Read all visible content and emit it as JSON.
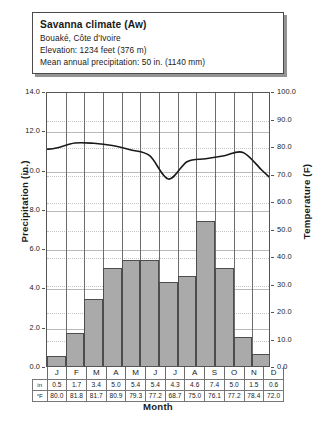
{
  "info": {
    "title": "Savanna climate (Aw)",
    "location": "Bouaké, Côte d'Ivoire",
    "elevation": "Elevation: 1234 feet (376 m)",
    "precipitation": "Mean annual precipitation: 50 in. (1140 mm)"
  },
  "chart_data": {
    "type": "bar",
    "title": "Savanna climate (Aw)",
    "xlabel": "Month",
    "ylabel": "Precipitation (in.)",
    "ylabel_secondary": "Temperature (F)",
    "categories": [
      "J",
      "F",
      "M",
      "A",
      "M",
      "J",
      "J",
      "A",
      "S",
      "O",
      "N",
      "D"
    ],
    "month_names": [
      "January",
      "February",
      "March",
      "April",
      "May",
      "June",
      "July",
      "August",
      "September",
      "October",
      "November",
      "December"
    ],
    "series": [
      {
        "name": "Precipitation (in.)",
        "type": "bar",
        "unit": "in",
        "values": [
          0.5,
          1.7,
          3.4,
          5.0,
          5.4,
          5.4,
          4.3,
          4.6,
          7.4,
          5.0,
          1.5,
          0.6
        ]
      },
      {
        "name": "Temperature (F)",
        "type": "line",
        "unit": "°F",
        "values": [
          80.0,
          81.8,
          81.7,
          80.9,
          79.3,
          77.2,
          68.7,
          75.0,
          76.1,
          77.2,
          78.4,
          72.0
        ]
      }
    ],
    "ylim": [
      0.0,
      14.0
    ],
    "ylim_secondary": [
      0.0,
      100.0
    ],
    "yticks": [
      "0.0",
      "2.0",
      "4.0",
      "6.0",
      "8.0",
      "10.0",
      "12.0",
      "14.0"
    ],
    "yticks_secondary": [
      "0.0",
      "10.0",
      "20.0",
      "30.0",
      "40.0",
      "50.0",
      "60.0",
      "70.0",
      "80.0",
      "90.0",
      "100.0"
    ],
    "grid": true,
    "legend": "none"
  },
  "table": {
    "row_labels": [
      "in",
      "°F"
    ],
    "months": [
      "J",
      "F",
      "M",
      "A",
      "M",
      "J",
      "J",
      "A",
      "S",
      "O",
      "N",
      "D"
    ],
    "precip": [
      "0.5",
      "1.7",
      "3.4",
      "5.0",
      "5.4",
      "5.4",
      "4.3",
      "4.6",
      "7.4",
      "5.0",
      "1.5",
      "0.6"
    ],
    "temp": [
      "80.0",
      "81.8",
      "81.7",
      "80.9",
      "79.3",
      "77.2",
      "68.7",
      "75.0",
      "76.1",
      "77.2",
      "78.4",
      "72.0"
    ]
  },
  "colors": {
    "bar_fill": "#aaaaaa",
    "bar_border": "#4d4d4d",
    "line": "#1a1a1a",
    "grid_solid": "#b9b9b9",
    "grid_dotted": "#c4c4c4"
  }
}
